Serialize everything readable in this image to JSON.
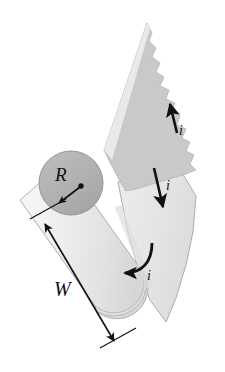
{
  "figure": {
    "background_color": "#ffffff",
    "width": 225,
    "height": 372,
    "labels": {
      "radius": "R",
      "width": "W",
      "current_top": "i",
      "current_middle": "i",
      "current_cylinder": "i"
    },
    "colors": {
      "sheet_upper": "#c9c9c9",
      "sheet_lower": "#e8e8e8",
      "cylinder_body": "#ededed",
      "cylinder_cap": "#b2b2b2",
      "outline": "#8a8a8a",
      "ink": "#111111",
      "background": "#ffffff"
    },
    "elements": {
      "cylinder_cap_name": "cylinder-end-cap",
      "cylinder_body_name": "cylinder-body",
      "sheet_upper_name": "torn-sheet-upper",
      "sheet_lower_name": "sheet-lower",
      "radius_arrow_name": "radius-arrow",
      "width_dimension_name": "width-dimension-arrow",
      "current_arrow_top_name": "current-arrow-up",
      "current_arrow_middle_name": "current-arrow-down",
      "current_arrow_curved_name": "current-arrow-curved"
    }
  }
}
